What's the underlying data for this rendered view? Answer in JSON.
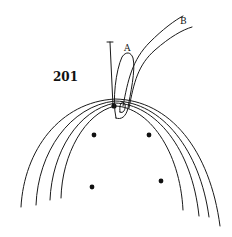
{
  "figure": {
    "reference_numeral": "201",
    "labels": {
      "a": "A",
      "b": "B"
    },
    "colors": {
      "line": "#1a1a1a",
      "background": "#ffffff"
    },
    "elements": {
      "arches_count": 4,
      "dots_count": 4,
      "dots": [
        {
          "x": 94,
          "y": 135
        },
        {
          "x": 149,
          "y": 135
        },
        {
          "x": 92,
          "y": 187
        },
        {
          "x": 161,
          "y": 181
        }
      ]
    }
  }
}
